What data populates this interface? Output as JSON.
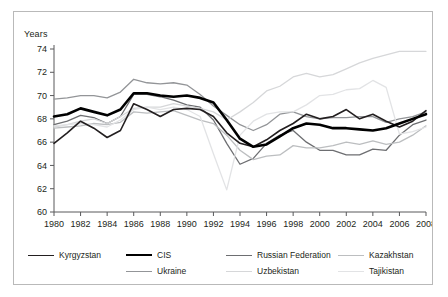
{
  "chart_data": {
    "type": "line",
    "title": "",
    "xlabel": "",
    "ylabel": "Years",
    "ylim": [
      60,
      74
    ],
    "xlim": [
      1980,
      2008
    ],
    "ytick_labels": [
      "60",
      "62",
      "64",
      "66",
      "68",
      "70",
      "72",
      "74"
    ],
    "yticks": [
      60,
      62,
      64,
      66,
      68,
      70,
      72,
      74
    ],
    "xtick_labels": [
      "1980",
      "1982",
      "1984",
      "1986",
      "1988",
      "1990",
      "1992",
      "1994",
      "1996",
      "1998",
      "2000",
      "2002",
      "2004",
      "2006",
      "2008"
    ],
    "xticks": [
      1980,
      1982,
      1984,
      1986,
      1988,
      1990,
      1992,
      1994,
      1996,
      1998,
      2000,
      2002,
      2004,
      2006,
      2008
    ],
    "grid": false,
    "legend_position": "bottom",
    "x": [
      1980,
      1981,
      1982,
      1983,
      1984,
      1985,
      1986,
      1987,
      1988,
      1989,
      1990,
      1991,
      1992,
      1993,
      1994,
      1995,
      1996,
      1997,
      1998,
      1999,
      2000,
      2001,
      2002,
      2003,
      2004,
      2005,
      2006,
      2007,
      2008
    ],
    "series": [
      {
        "name": "Kyrgyzstan",
        "color": "#231f20",
        "width": 1.6,
        "values": [
          65.9,
          66.8,
          67.8,
          67.2,
          66.4,
          67.0,
          69.3,
          68.8,
          68.2,
          68.8,
          68.9,
          68.8,
          68.2,
          66.8,
          65.9,
          65.6,
          66.2,
          67.0,
          67.6,
          68.4,
          68.0,
          68.2,
          68.8,
          68.0,
          68.4,
          67.8,
          67.3,
          67.8,
          68.7
        ]
      },
      {
        "name": "CIS",
        "color": "#000000",
        "width": 2.6,
        "values": [
          68.2,
          68.4,
          68.9,
          68.6,
          68.3,
          68.8,
          70.2,
          70.2,
          70.0,
          69.9,
          70.0,
          69.8,
          69.4,
          67.9,
          66.3,
          65.6,
          65.8,
          66.5,
          67.2,
          67.6,
          67.5,
          67.2,
          67.2,
          67.1,
          67.0,
          67.2,
          67.6,
          68.0,
          68.4
        ]
      },
      {
        "name": "Russian Federation",
        "color": "#6d6e71",
        "width": 1.3,
        "values": [
          67.5,
          67.8,
          68.3,
          68.1,
          67.6,
          68.2,
          70.1,
          70.1,
          69.9,
          69.6,
          69.2,
          69.0,
          67.9,
          65.9,
          64.1,
          64.6,
          65.9,
          66.6,
          67.0,
          66.0,
          65.3,
          65.3,
          64.9,
          64.9,
          65.4,
          65.3,
          66.6,
          67.5,
          67.9
        ]
      },
      {
        "name": "Kazakhstan",
        "color": "#bcbec0",
        "width": 1.3,
        "values": [
          67.2,
          67.3,
          67.4,
          67.6,
          67.5,
          67.7,
          68.6,
          68.5,
          68.6,
          68.7,
          68.3,
          67.9,
          67.6,
          66.6,
          65.3,
          64.5,
          64.8,
          64.9,
          65.7,
          65.5,
          65.5,
          65.7,
          66.0,
          65.8,
          66.1,
          65.8,
          66.0,
          66.6,
          67.4
        ]
      },
      {
        "name": "Ukraine",
        "color": "#939598",
        "width": 1.3,
        "values": [
          69.7,
          69.8,
          70.0,
          70.0,
          69.8,
          70.3,
          71.4,
          71.1,
          71.0,
          71.1,
          70.9,
          70.1,
          69.1,
          68.3,
          67.5,
          67.0,
          67.5,
          68.4,
          68.6,
          68.2,
          68.0,
          68.1,
          68.1,
          68.2,
          68.2,
          67.7,
          68.0,
          68.2,
          68.6
        ]
      },
      {
        "name": "Uzbekistan",
        "color": "#d6d7d9",
        "width": 1.3,
        "values": [
          67.3,
          67.5,
          67.8,
          68.0,
          67.6,
          68.2,
          68.9,
          69.0,
          69.0,
          69.3,
          69.1,
          68.9,
          68.6,
          67.9,
          68.6,
          69.4,
          70.4,
          70.8,
          71.6,
          71.9,
          71.6,
          71.8,
          72.3,
          72.8,
          73.2,
          73.5,
          73.8,
          73.8,
          73.8
        ]
      },
      {
        "name": "Tajikistan",
        "color": "#e2e3e5",
        "width": 1.3,
        "values": [
          67.4,
          67.5,
          67.6,
          67.5,
          67.3,
          67.9,
          68.8,
          69.0,
          68.8,
          69.0,
          68.8,
          68.2,
          65.0,
          61.9,
          66.6,
          67.8,
          68.4,
          68.6,
          68.6,
          69.2,
          70.0,
          70.1,
          70.5,
          70.6,
          71.3,
          70.7,
          66.7,
          66.9,
          67.3
        ]
      }
    ]
  },
  "legend": {
    "row1": [
      {
        "label": "Kyrgyzstan",
        "color": "#231f20",
        "width": "1.6"
      },
      {
        "label": "CIS",
        "color": "#000000",
        "width": "2.6"
      },
      {
        "label": "Russian Federation",
        "color": "#6d6e71",
        "width": "1.3"
      },
      {
        "label": "Kazakhstan",
        "color": "#bcbec0",
        "width": "1.3"
      }
    ],
    "row2": [
      {
        "label": "Ukraine",
        "color": "#939598",
        "width": "1.3"
      },
      {
        "label": "Uzbekistan",
        "color": "#d6d7d9",
        "width": "1.3"
      },
      {
        "label": "Tajikistan",
        "color": "#e2e3e5",
        "width": "1.3"
      }
    ]
  }
}
